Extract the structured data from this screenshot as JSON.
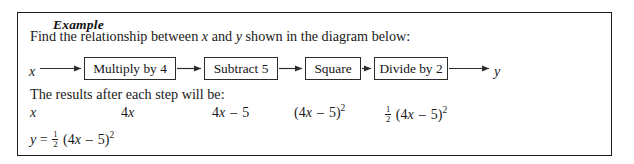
{
  "example_box": {
    "legend": "Example",
    "prompt": {
      "before_x": "Find the relationship between ",
      "var_x": "x",
      "between": " and ",
      "var_y": "y",
      "after_y": " shown in the diagram below:"
    },
    "results_intro": "The results after each step will be:"
  },
  "diagram": {
    "input_label": "x",
    "output_label": "y",
    "steps": [
      {
        "label": "Multiply by 4"
      },
      {
        "label": "Subtract 5"
      },
      {
        "label": "Square"
      },
      {
        "label": "Divide by 2"
      }
    ],
    "arrow_count": 5
  },
  "results": {
    "terms": [
      {
        "id": "term-x",
        "text": "x"
      },
      {
        "id": "term-4x",
        "text": "4x"
      },
      {
        "id": "term-4x-5",
        "text": "4x – 5"
      },
      {
        "id": "term-4x-5-sq",
        "text": "(4x – 5)²"
      },
      {
        "id": "term-half-sq",
        "text": "½ (4x – 5)²"
      }
    ],
    "final_equation": "y = ½ (4x – 5)²",
    "final_parts": {
      "lhs": "y",
      "equals": "=",
      "fraction_numerator": "1",
      "fraction_denominator": "2",
      "expression_open": "(4",
      "expression_var": "x",
      "expression_minus": "–",
      "expression_five": "5)",
      "expression_power": "2"
    }
  },
  "colors": {
    "ink": "#1a1a1a",
    "border": "#1c1c1c",
    "node_border": "#2b2b2b",
    "background": "#ffffff"
  }
}
